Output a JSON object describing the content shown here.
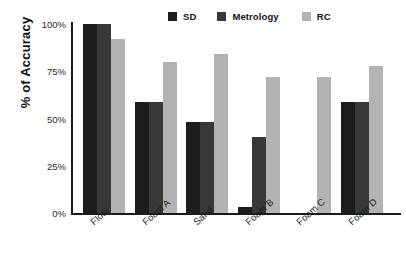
{
  "chart_data": {
    "type": "bar",
    "title": "",
    "xlabel": "",
    "ylabel": "% of Accuracy",
    "categories": [
      "Floor",
      "Foam A",
      "Sand",
      "Foam B",
      "Foam C",
      "Foam D"
    ],
    "series": [
      {
        "name": "SD",
        "color": "#1c1c1c",
        "values": [
          100,
          59,
          48,
          3,
          0,
          59
        ]
      },
      {
        "name": "Metrology",
        "color": "#383838",
        "values": [
          100,
          59,
          48,
          40,
          0,
          59
        ]
      },
      {
        "name": "RC",
        "color": "#b3b3b3",
        "values": [
          92,
          80,
          84,
          72,
          72,
          78
        ]
      }
    ],
    "ylim": [
      0,
      100
    ],
    "y_ticks": [
      0,
      25,
      50,
      75,
      100
    ],
    "y_tick_labels": [
      "0%",
      "25%",
      "50%",
      "75%",
      "100%"
    ],
    "grid": false,
    "legend_position": "top-right",
    "bar_value_labels": false
  },
  "legend": {
    "entries": [
      {
        "label": "SD",
        "swatch_color": "#1c1c1c"
      },
      {
        "label": "Metrology",
        "swatch_color": "#383838"
      },
      {
        "label": "RC",
        "swatch_color": "#b3b3b3"
      }
    ]
  },
  "axes": {
    "y_title": "% of Accuracy",
    "y_tick_labels": [
      "100%",
      "75%",
      "50%",
      "25%",
      "0%"
    ],
    "x_tick_labels": [
      "Floor",
      "Foam A",
      "Sand",
      "Foam B",
      "Foam C",
      "Foam D"
    ],
    "axis_color": "#1b1b1b"
  }
}
